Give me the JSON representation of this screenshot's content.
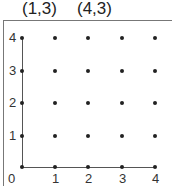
{
  "labels": {
    "point_a": "(1,3)",
    "point_b": "(4,3)"
  },
  "y_ticks": [
    "4",
    "3",
    "2",
    "1"
  ],
  "x_ticks": [
    "0",
    "1",
    "2",
    "3",
    "4"
  ],
  "grid": {
    "cols": 5,
    "rows": 5
  }
}
